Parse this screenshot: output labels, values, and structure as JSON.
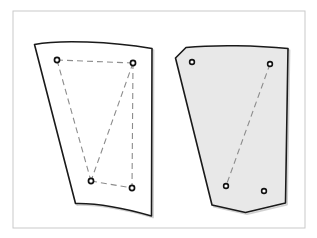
{
  "figure": {
    "canvas": {
      "width": 317,
      "height": 238,
      "background": "#ffffff"
    },
    "frame": {
      "label": "Drawing border",
      "x": 13,
      "y": 11,
      "width": 292,
      "height": 217,
      "stroke": "#c9c9c9",
      "stroke_width": 1,
      "fill": "none"
    },
    "colors": {
      "outline": "#1a1a1a",
      "dashed_line": "#8c8c8c",
      "panel_fill_left": "#ffffff",
      "panel_fill_right": "#e8e8e8",
      "hole_ring": "#111111",
      "hole_center": "#ffffff",
      "frame": "#c9c9c9",
      "shadow": "#9a9a9a"
    },
    "panels": [
      {
        "id": "panel-left",
        "name": "Left panel (unshaded)",
        "fill": "#ffffff",
        "stroke": "#1a1a1a",
        "stroke_width": 1.6,
        "outline_path": "M 34.5 44.5 C 60 39.5 110 41.5 152 48.5 L 151.5 216 C 124 208 98 203 75.5 203.5 Z",
        "holes": [
          {
            "id": "hole-L1",
            "label": "top-left hole",
            "cx": 57,
            "cy": 60,
            "r_outer": 3.4,
            "r_inner": 1.7
          },
          {
            "id": "hole-L2",
            "label": "top-right hole",
            "cx": 133,
            "cy": 63,
            "r_outer": 3.4,
            "r_inner": 1.7
          },
          {
            "id": "hole-L3",
            "label": "bottom-left hole",
            "cx": 91,
            "cy": 181,
            "r_outer": 3.4,
            "r_inner": 1.7
          },
          {
            "id": "hole-L4",
            "label": "bottom-right hole",
            "cx": 132,
            "cy": 188,
            "r_outer": 3.4,
            "r_inner": 1.7
          }
        ],
        "dashed_segments": [
          {
            "id": "dash-L-top",
            "label": "top edge construction line",
            "x1": 57,
            "y1": 60,
            "x2": 133,
            "y2": 63
          },
          {
            "id": "dash-L-left-diagonal",
            "label": "left diagonal construction line",
            "x1": 57,
            "y1": 60,
            "x2": 91,
            "y2": 181
          },
          {
            "id": "dash-L-right-diagonal",
            "label": "right diagonal construction line",
            "x1": 133,
            "y1": 63,
            "x2": 91,
            "y2": 181
          },
          {
            "id": "dash-L-right-vertical",
            "label": "right vertical construction line",
            "x1": 133,
            "y1": 63,
            "x2": 132,
            "y2": 188
          },
          {
            "id": "dash-L-bottom",
            "label": "bottom edge construction line",
            "x1": 91,
            "y1": 181,
            "x2": 132,
            "y2": 188
          }
        ]
      },
      {
        "id": "panel-right",
        "name": "Right panel (shaded)",
        "fill": "#e8e8e8",
        "stroke": "#1a1a1a",
        "stroke_width": 1.6,
        "outline_path": "M 186 47.5 C 215 44.5 258 45.5 288 48.5 L 285.5 203 L 245.5 212.5 L 212 205 L 175.5 58 Z",
        "holes": [
          {
            "id": "hole-R1",
            "label": "top-left hole",
            "cx": 192,
            "cy": 62,
            "r_outer": 3.2,
            "r_inner": 1.6
          },
          {
            "id": "hole-R2",
            "label": "top-right hole",
            "cx": 270,
            "cy": 64,
            "r_outer": 3.2,
            "r_inner": 1.6
          },
          {
            "id": "hole-R3",
            "label": "bottom-left hole",
            "cx": 226,
            "cy": 186,
            "r_outer": 3.2,
            "r_inner": 1.6
          },
          {
            "id": "hole-R4",
            "label": "bottom-right hole",
            "cx": 264,
            "cy": 191,
            "r_outer": 3.2,
            "r_inner": 1.6
          }
        ],
        "dashed_segments": [
          {
            "id": "dash-R-diagonal",
            "label": "diagonal construction line",
            "x1": 270,
            "y1": 64,
            "x2": 226,
            "y2": 186
          }
        ]
      }
    ],
    "dash_style": {
      "pattern": "6 4",
      "width": 1.1
    }
  }
}
